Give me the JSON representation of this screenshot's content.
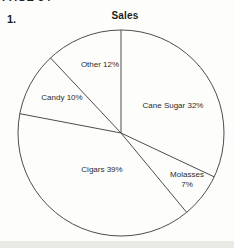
{
  "page": {
    "header_cut_text": "PAGE 54",
    "question_number": "1."
  },
  "chart_data": {
    "type": "pie",
    "title": "Sales",
    "unit": "percent",
    "start_angle_deg": 0,
    "direction": "clockwise",
    "fill": "none",
    "stroke_color": "#4d4d4d",
    "slices": [
      {
        "name": "Cane Sugar",
        "value": 32,
        "label": "Cane Sugar 32%"
      },
      {
        "name": "Molasses",
        "value": 7,
        "label": "Molasses\n7%"
      },
      {
        "name": "Cigars",
        "value": 39,
        "label": "Cigars 39%"
      },
      {
        "name": "Candy",
        "value": 10,
        "label": "Candy 10%"
      },
      {
        "name": "Other",
        "value": 12,
        "label": "Other 12%"
      }
    ]
  }
}
